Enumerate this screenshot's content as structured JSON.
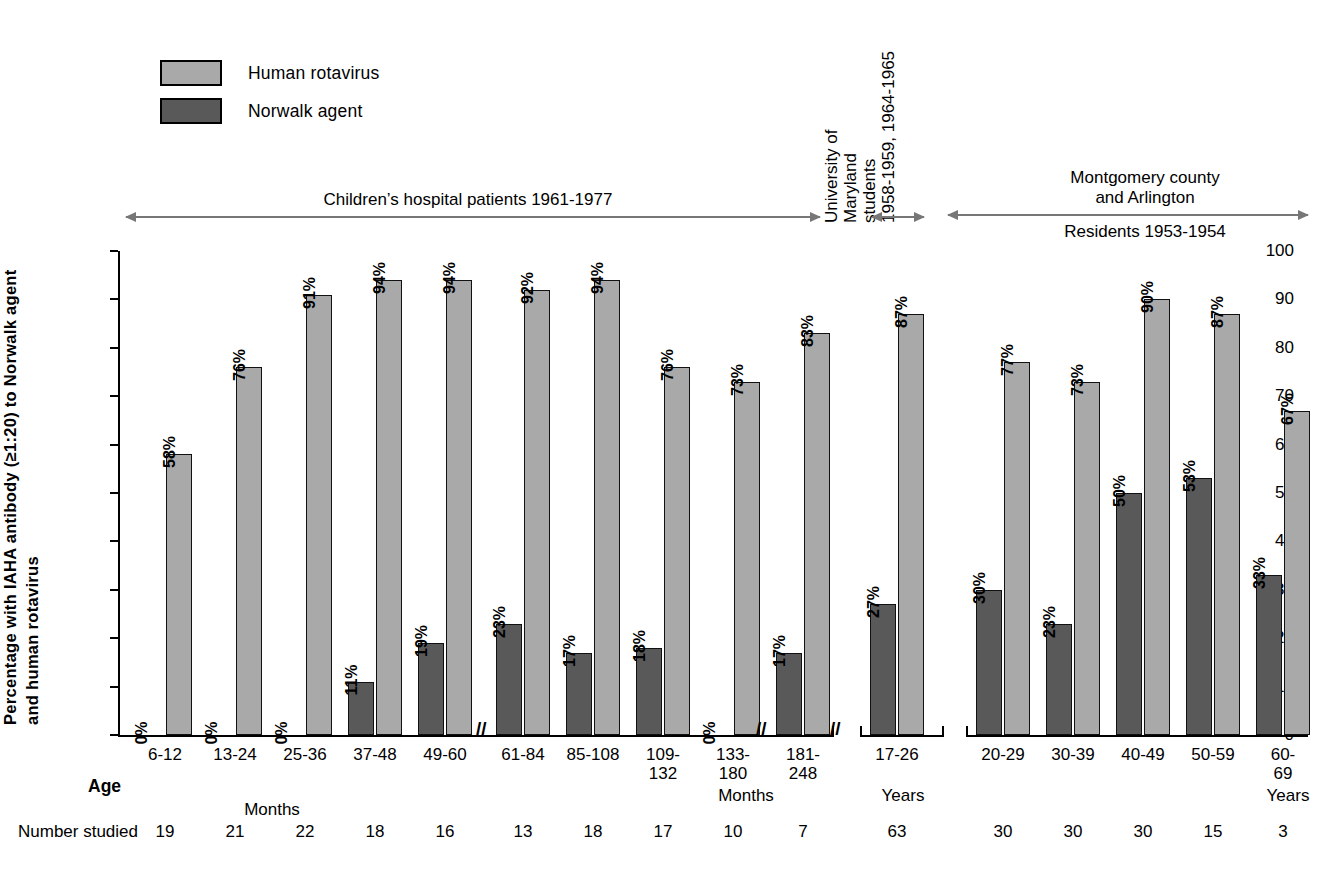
{
  "legend": {
    "items": [
      {
        "label": "Human rotavirus",
        "color": "#a9a9a9",
        "name": "human-rotavirus"
      },
      {
        "label": "Norwalk agent",
        "color": "#595959",
        "name": "norwalk-agent"
      }
    ]
  },
  "axis": {
    "y_title_line1": "Percentage with IAHA antibody (≥1:20) to Norwalk agent",
    "y_title_line2": "and human rotavirus",
    "y_ticks": [
      "0",
      "10",
      "20",
      "30",
      "40",
      "50",
      "60",
      "70",
      "80",
      "90",
      "100"
    ],
    "age_label": "Age",
    "number_studied_label": "Number studied",
    "unit_months": "Months",
    "unit_years": "Years"
  },
  "annotations": {
    "children": "Children’s hospital patients 1961-1977",
    "maryland": [
      "University of",
      "Maryland",
      "students",
      "1958-1959, 1964-1965"
    ],
    "montgomery_line1": "Montgomery county",
    "montgomery_line2": "and Arlington",
    "montgomery_sub": "Residents 1953-1954"
  },
  "chart_data": {
    "type": "bar",
    "title": "",
    "xlabel": "Age",
    "ylabel": "Percentage with IAHA antibody (≥1:20) to Norwalk agent and human rotavirus",
    "ylim": [
      0,
      100
    ],
    "ytick_step": 10,
    "grid": false,
    "legend_position": "top-left",
    "categories": [
      "6-12",
      "13-24",
      "25-36",
      "37-48",
      "49-60",
      "61-84",
      "85-108",
      "109-132",
      "133-180",
      "181-248",
      "17-26",
      "20-29",
      "30-39",
      "40-49",
      "50-59",
      "60-69"
    ],
    "category_units": [
      "Months",
      "Months",
      "Months",
      "Months",
      "Months",
      "Months",
      "Months",
      "Months",
      "Months",
      "Months",
      "Years",
      "Years",
      "Years",
      "Years",
      "Years",
      "Years"
    ],
    "series": [
      {
        "name": "Norwalk agent",
        "color": "#595959",
        "values": [
          0,
          0,
          0,
          11,
          19,
          23,
          17,
          18,
          0,
          17,
          27,
          30,
          23,
          50,
          53,
          33
        ],
        "labels": [
          "0%",
          "0%",
          "0%",
          "11%",
          "19%",
          "23%",
          "17%",
          "18%",
          "0%",
          "17%",
          "27%",
          "30%",
          "23%",
          "50%",
          "53%",
          "33%"
        ]
      },
      {
        "name": "Human rotavirus",
        "color": "#a9a9a9",
        "values": [
          58,
          76,
          91,
          94,
          94,
          92,
          94,
          76,
          73,
          83,
          87,
          77,
          73,
          90,
          87,
          67
        ],
        "labels": [
          "58%",
          "76%",
          "91%",
          "94%",
          "94%",
          "92%",
          "94%",
          "76%",
          "73%",
          "83%",
          "87%",
          "77%",
          "73%",
          "90%",
          "87%",
          "67%"
        ]
      }
    ],
    "number_studied": [
      19,
      21,
      22,
      18,
      16,
      13,
      18,
      17,
      10,
      7,
      63,
      30,
      30,
      30,
      15,
      3
    ],
    "groups": [
      {
        "label": "Children’s hospital patients 1961-1977",
        "from": 0,
        "to": 9
      },
      {
        "label": "University of Maryland students 1958-1959, 1964-1965",
        "from": 10,
        "to": 10
      },
      {
        "label": "Montgomery county and Arlington Residents 1953-1954",
        "from": 11,
        "to": 15
      }
    ],
    "axis_breaks_after": [
      "49-60",
      "109-132",
      "133-180"
    ]
  }
}
